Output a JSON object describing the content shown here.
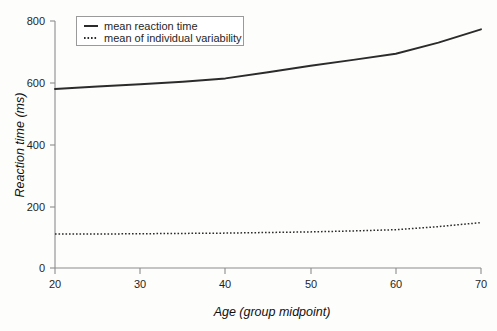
{
  "chart_data": {
    "type": "line",
    "title": "",
    "xlabel": "Age (group midpoint)",
    "ylabel": "Reaction time (ms)",
    "xlim": [
      20,
      70
    ],
    "ylim": [
      0,
      800
    ],
    "xticks": [
      20,
      30,
      40,
      50,
      60,
      70
    ],
    "yticks": [
      0,
      200,
      400,
      600,
      800
    ],
    "xtick_labels": [
      "20",
      "30",
      "40",
      "50",
      "60",
      "70"
    ],
    "ytick_labels": [
      "0",
      "200",
      "400",
      "600",
      "800"
    ],
    "grid": false,
    "legend_position": "top-left",
    "x": [
      20,
      25,
      30,
      35,
      40,
      45,
      50,
      55,
      60,
      65,
      70
    ],
    "series": [
      {
        "name": "mean reaction time",
        "style": "solid",
        "values": [
          580,
          588,
          595,
          603,
          614,
          634,
          655,
          674,
          694,
          730,
          773
        ]
      },
      {
        "name": "mean of individual variability",
        "style": "dotted",
        "values": [
          110,
          110,
          111,
          112,
          113,
          115,
          117,
          120,
          124,
          134,
          147
        ]
      }
    ],
    "colors": {
      "series_line": "#2b2b2b",
      "axis": "#8c8c8c",
      "text": "#1f1f1f",
      "background": "#fdfdfc",
      "legend_border": "#9a9a9a"
    }
  },
  "legend": {
    "items": [
      {
        "label": "mean reaction time"
      },
      {
        "label": "mean of individual variability"
      }
    ]
  },
  "axes": {
    "y_title": "Reaction time (ms)",
    "x_title": "Age (group midpoint)",
    "y_labels": [
      "800",
      "600",
      "400",
      "200",
      "0"
    ],
    "x_labels": [
      "20",
      "30",
      "40",
      "50",
      "60",
      "70"
    ]
  }
}
